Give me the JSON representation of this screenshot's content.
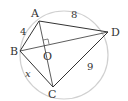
{
  "diagram": {
    "type": "cyclic quadrilateral inscribed in circle",
    "points": {
      "A": "A",
      "B": "B",
      "C": "C",
      "D": "D",
      "O": "O"
    },
    "labels": {
      "AB": "4",
      "AD": "8",
      "CD": "9",
      "BC": "x"
    },
    "colors": {
      "line": "#333333",
      "circle": "#cccccc"
    }
  }
}
